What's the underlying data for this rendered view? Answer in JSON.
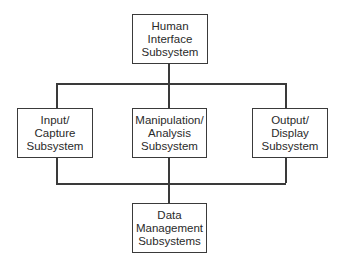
{
  "diagram": {
    "type": "hierarchy",
    "nodes": {
      "human_interface": {
        "label": "Human\nInterface\nSubsystem"
      },
      "input_capture": {
        "label": "Input/\nCapture\nSubsystem"
      },
      "manipulation_analysis": {
        "label": "Manipulation/\nAnalysis\nSubsystem"
      },
      "output_display": {
        "label": "Output/\nDisplay\nSubsystem"
      },
      "data_management": {
        "label": "Data\nManagement\nSubsystems"
      }
    },
    "edges": [
      {
        "from": "human_interface",
        "to": "input_capture"
      },
      {
        "from": "human_interface",
        "to": "manipulation_analysis"
      },
      {
        "from": "human_interface",
        "to": "output_display"
      },
      {
        "from": "input_capture",
        "to": "data_management"
      },
      {
        "from": "manipulation_analysis",
        "to": "data_management"
      },
      {
        "from": "output_display",
        "to": "data_management"
      }
    ]
  }
}
